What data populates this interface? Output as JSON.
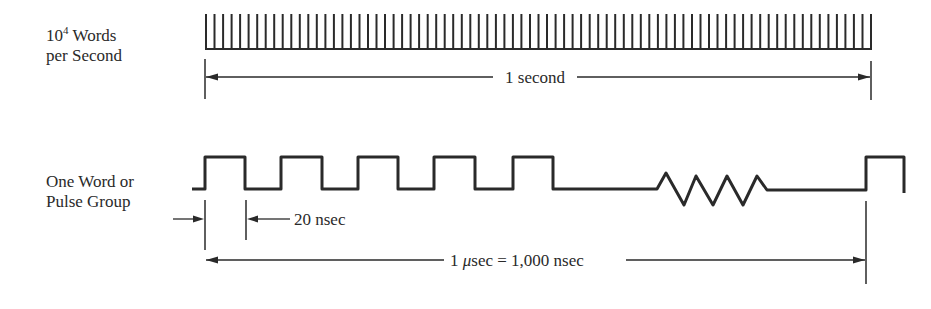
{
  "top_section": {
    "label_line1_base": "10",
    "label_line1_exp": "4",
    "label_line1_rest": " Words",
    "label_line2": "per Second",
    "tick_count": 79,
    "span_label": "1 second"
  },
  "bottom_section": {
    "label_line1": "One Word or",
    "label_line2": "Pulse Group",
    "pulse_count": 5,
    "pulse_width_label": "20 nsec",
    "span_label_num": "1 ",
    "span_label_unit": "μ",
    "span_label_rest": "sec = 1,000 nsec",
    "break_symbol": "zigzag"
  },
  "colors": {
    "ink": "#2a2a2a",
    "background": "#ffffff"
  }
}
